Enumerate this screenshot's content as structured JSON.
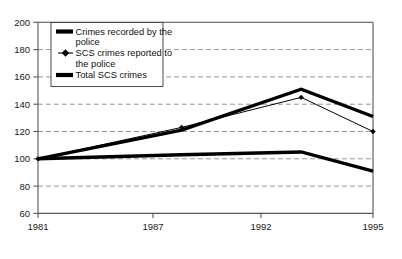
{
  "chart_data": {
    "type": "line",
    "title": "",
    "xlabel": "",
    "ylabel": "",
    "x": [
      "1981",
      "1987",
      "1992",
      "1995"
    ],
    "x_numeric": [
      1981,
      1987,
      1992,
      1995
    ],
    "categories": [
      "1981",
      "1987",
      "1992",
      "1995"
    ],
    "ylim": [
      60,
      200
    ],
    "yticks": [
      60,
      80,
      100,
      120,
      140,
      160,
      180,
      200
    ],
    "ytick_labels": [
      "60",
      "80",
      "100",
      "120",
      "140",
      "160",
      "180",
      "200"
    ],
    "xtick_labels": [
      "1981",
      "1987",
      "1992",
      "1995"
    ],
    "grid": "horizontal-dashed",
    "legend_position": "top-left-inside",
    "series": [
      {
        "name": "Crimes recorded by the police",
        "values": [
          100,
          121,
          151,
          131
        ],
        "style": "thick-line",
        "color": "#000000",
        "marker": "none"
      },
      {
        "name": "SCS crimes reported to the police",
        "values": [
          100,
          123,
          145,
          120
        ],
        "style": "thin-line",
        "color": "#000000",
        "marker": "diamond"
      },
      {
        "name": "Total SCS crimes",
        "values": [
          100,
          103,
          105,
          91
        ],
        "style": "thick-line",
        "color": "#000000",
        "marker": "none"
      }
    ]
  },
  "axes": {
    "y": {
      "labels": [
        "200",
        "180",
        "160",
        "140",
        "120",
        "100",
        "80",
        "60"
      ]
    },
    "x": {
      "labels": [
        "1981",
        "1987",
        "1992",
        "1995"
      ]
    }
  },
  "legend": {
    "entries": [
      {
        "label_line1": "Crimes recorded by the",
        "label_line2": "police",
        "marker": "thick-bar"
      },
      {
        "label_line1": "SCS crimes reported to",
        "label_line2": "the police",
        "marker": "thin-line-diamond"
      },
      {
        "label_line1": "Total SCS crimes",
        "label_line2": "",
        "marker": "thick-bar"
      }
    ]
  },
  "colors": {
    "background": "#ffffff",
    "series": "#000000",
    "grid": "#8a8a8a",
    "axis": "#555555"
  }
}
